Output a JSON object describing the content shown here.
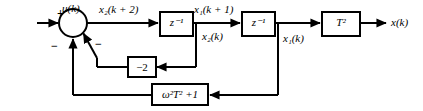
{
  "diagram": {
    "stroke_color": "#000000",
    "background_color": "#ffffff",
    "signals": {
      "input": "u(k)",
      "sum_output": "x₂(k + 2)",
      "after_first_delay": "x₁(k + 1)",
      "first_delay_tap": "x₂(k)",
      "after_second_delay": "x₁(k)",
      "output": "x(k)"
    },
    "summing_junction": {
      "name": "summing-junction",
      "sign_input": "+",
      "sign_feedback_outer": "−",
      "sign_feedback_inner": "−"
    },
    "blocks": [
      {
        "id": "delay1",
        "label": "z⁻¹",
        "base": "z",
        "exponent": "-1"
      },
      {
        "id": "delay2",
        "label": "z⁻¹",
        "base": "z",
        "exponent": "-1"
      },
      {
        "id": "gain_t2",
        "label": "T²",
        "base": "T",
        "exponent": "2"
      },
      {
        "id": "gain_neg2",
        "label": "−2"
      },
      {
        "id": "feedback_omega",
        "label": "ω²T² +1"
      }
    ]
  }
}
